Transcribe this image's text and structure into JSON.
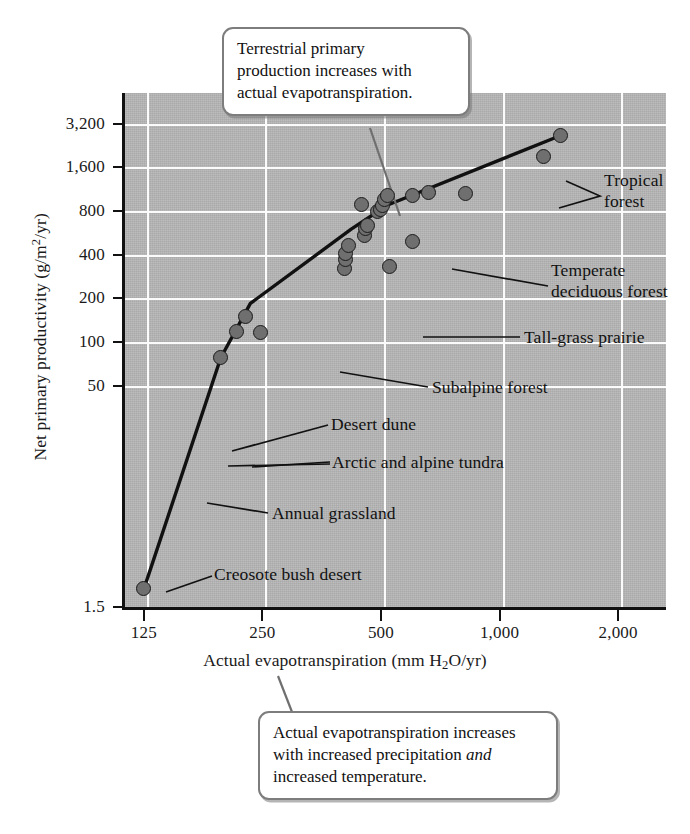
{
  "figure": {
    "background_color": "#ffffff",
    "plot_background_color": "#b6b6b6",
    "gridline_color": "#fbfbfb",
    "point_fill_color": "#6f6f6f",
    "point_edge_color": "#1b1b1b",
    "trend_line_color": "#111111",
    "callout_border_color": "#7d7d7d"
  },
  "callouts": {
    "top": {
      "line1": "Terrestrial primary",
      "line2": "production increases with",
      "line3": "actual evapotranspiration."
    },
    "bottom": {
      "line1": "Actual evapotranspiration increases",
      "line2_a": "with increased precipitation ",
      "line2_italic": "and",
      "line3": "increased temperature."
    }
  },
  "chart_data": {
    "type": "scatter",
    "title": "",
    "xlabel": "Actual evapotranspiration (mm H2O/yr)",
    "ylabel": "Net primary productivity (g/m2/yr)",
    "xscale": "log",
    "yscale": "log",
    "xlim": [
      110,
      2600
    ],
    "ylim": [
      1.5,
      5200
    ],
    "grid": true,
    "legend": "none",
    "xticks": [
      {
        "value": 125,
        "label": "125"
      },
      {
        "value": 250,
        "label": "250"
      },
      {
        "value": 500,
        "label": "500"
      },
      {
        "value": 1000,
        "label": "1,000"
      },
      {
        "value": 2000,
        "label": "2,000"
      }
    ],
    "yticks": [
      {
        "value": 3200,
        "label": "3,200"
      },
      {
        "value": 1600,
        "label": "1,600"
      },
      {
        "value": 800,
        "label": "800"
      },
      {
        "value": 400,
        "label": "400"
      },
      {
        "value": 200,
        "label": "200"
      },
      {
        "value": 100,
        "label": "100"
      },
      {
        "value": 50,
        "label": "50"
      },
      {
        "value": 1.5,
        "label": "1.5"
      }
    ],
    "points": [
      {
        "x": 125,
        "y": 2.0,
        "label": "Creosote bush desert"
      },
      {
        "x": 196,
        "y": 78,
        "label": "Annual grassland"
      },
      {
        "x": 215,
        "y": 118,
        "label": "Arctic and alpine tundra"
      },
      {
        "x": 247,
        "y": 116,
        "label": "Arctic and alpine tundra"
      },
      {
        "x": 226,
        "y": 150,
        "label": "Desert dune"
      },
      {
        "x": 404,
        "y": 320,
        "label": ""
      },
      {
        "x": 406,
        "y": 370,
        "label": ""
      },
      {
        "x": 407,
        "y": 410,
        "label": ""
      },
      {
        "x": 414,
        "y": 465,
        "label": ""
      },
      {
        "x": 453,
        "y": 545,
        "label": ""
      },
      {
        "x": 456,
        "y": 605,
        "label": ""
      },
      {
        "x": 462,
        "y": 640,
        "label": ""
      },
      {
        "x": 524,
        "y": 330,
        "label": "Subalpine forest"
      },
      {
        "x": 600,
        "y": 490,
        "label": "Tall-grass prairie"
      },
      {
        "x": 445,
        "y": 890,
        "label": ""
      },
      {
        "x": 489,
        "y": 790,
        "label": ""
      },
      {
        "x": 500,
        "y": 820,
        "label": ""
      },
      {
        "x": 505,
        "y": 880,
        "label": ""
      },
      {
        "x": 509,
        "y": 960,
        "label": ""
      },
      {
        "x": 520,
        "y": 1020,
        "label": ""
      },
      {
        "x": 600,
        "y": 1020,
        "label": ""
      },
      {
        "x": 660,
        "y": 1070,
        "label": "Temperate deciduous forest"
      },
      {
        "x": 820,
        "y": 1060,
        "label": ""
      },
      {
        "x": 1290,
        "y": 1900,
        "label": "Tropical forest"
      },
      {
        "x": 1430,
        "y": 2650,
        "label": "Tropical forest"
      }
    ],
    "trend_line": {
      "description": "fitted curve through points",
      "vertices": [
        {
          "x": 125,
          "y": 2.0
        },
        {
          "x": 196,
          "y": 78
        },
        {
          "x": 233,
          "y": 185
        },
        {
          "x": 420,
          "y": 600
        },
        {
          "x": 520,
          "y": 880
        },
        {
          "x": 1430,
          "y": 2650
        }
      ]
    }
  },
  "annotations": [
    {
      "name": "tropical-forest",
      "line1": "Tropical",
      "line2": "forest"
    },
    {
      "name": "temperate-deciduous-forest",
      "line1": "Temperate",
      "line2": "deciduous forest"
    },
    {
      "name": "tall-grass-prairie",
      "line1": "Tall-grass prairie",
      "line2": ""
    },
    {
      "name": "subalpine-forest",
      "line1": "Subalpine forest",
      "line2": ""
    },
    {
      "name": "desert-dune",
      "line1": "Desert dune",
      "line2": ""
    },
    {
      "name": "arctic-and-alpine-tundra",
      "line1": "Arctic and alpine tundra",
      "line2": ""
    },
    {
      "name": "annual-grassland",
      "line1": "Annual grassland",
      "line2": ""
    },
    {
      "name": "creosote-bush-desert",
      "line1": "Creosote bush desert",
      "line2": ""
    }
  ]
}
